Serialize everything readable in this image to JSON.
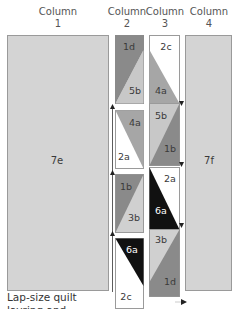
{
  "columns": [
    {
      "title": "Column",
      "number": "1"
    },
    {
      "title": "Column",
      "number": "2"
    },
    {
      "title": "Column",
      "number": "3"
    },
    {
      "title": "Column",
      "number": "4"
    }
  ],
  "column1_piece": "7e",
  "column4_piece": "7f",
  "column2_blocks": [
    {
      "top": "1d",
      "bottom": "5b"
    },
    {
      "top": "4a",
      "bottom": "2a"
    },
    {
      "top": "1b",
      "bottom": "3b"
    },
    {
      "top": "6a",
      "bottom": "2c"
    }
  ],
  "column3_blocks": [
    {
      "top": "2c",
      "bottom": "4a"
    },
    {
      "top": "5b",
      "bottom": "1b"
    },
    {
      "top": "2a",
      "bottom": "6a"
    },
    {
      "top": "3b",
      "bottom": "1d"
    }
  ],
  "caption": {
    "line1": "Lap-size quilt",
    "line2": "layring and ..."
  },
  "colors": {
    "light_gray": "#d4d4d4",
    "mid_gray": "#a6a6a6",
    "dark_gray": "#8a8a8a",
    "black": "#111111",
    "white": "#ffffff",
    "outline": "#9a9a9a"
  }
}
